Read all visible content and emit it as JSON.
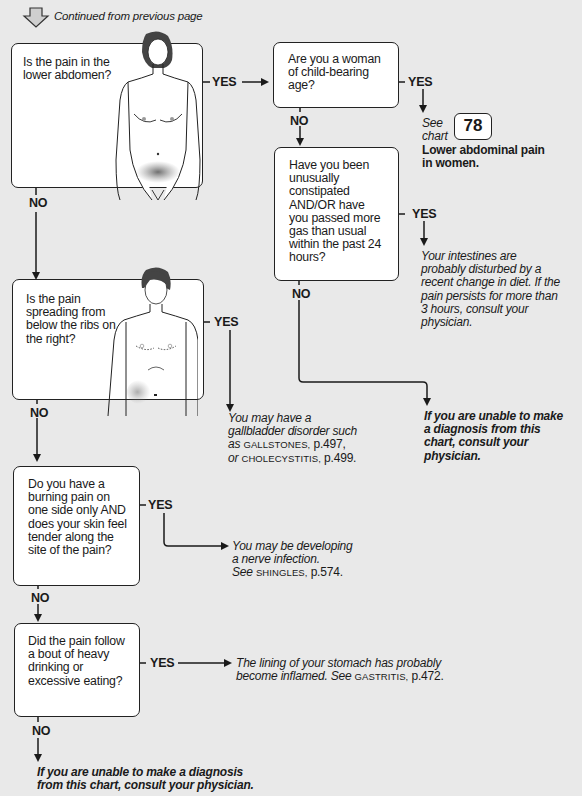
{
  "header": {
    "continued_label": "Continued from previous page",
    "icon": "down-arrow-outline-icon"
  },
  "labels": {
    "yes": "YES",
    "no": "NO"
  },
  "questions": [
    {
      "id": "q1",
      "text": "Is the pain in the lower abdomen?",
      "illustration": "female-figure-lower-abdomen-shaded"
    },
    {
      "id": "q2",
      "text": "Are you a woman of child-bearing age?"
    },
    {
      "id": "q3",
      "text": "Have you been unusually constipated AND/OR have you passed more gas than usual within the past 24 hours?"
    },
    {
      "id": "q4",
      "text": "Is the pain spreading from below the ribs on the right?",
      "illustration": "male-figure-right-upper-abdomen-shaded"
    },
    {
      "id": "q5",
      "text": "Do you have a burning pain on one side only AND does your skin feel tender along the site of the pain?"
    },
    {
      "id": "q6",
      "text": "Did the pain follow a bout of heavy drinking or excessive eating?"
    }
  ],
  "outcomes": {
    "see_chart": {
      "see": "See",
      "chart": "chart",
      "number": "78",
      "title": "Lower abdominal pain in women."
    },
    "intestines": "Your intestines are probably disturbed by a recent change in diet. If the pain persists for more than 3 hours, consult your physician.",
    "unable_right": "If you are unable to make a diagnosis from this chart, consult your physician.",
    "gallbladder": {
      "intro": "You may have a gallbladder disorder such as",
      "ref1": "GALLSTONES,",
      "page1": "p.497,",
      "or": "or",
      "ref2": "CHOLECYSTITIS,",
      "page2": "p.499."
    },
    "shingles": {
      "intro": "You may be developing a nerve infection.",
      "see": "See",
      "ref": "SHINGLES,",
      "page": "p.574."
    },
    "gastritis": {
      "intro": "The lining of your stomach has probably become inflamed.",
      "see": "See",
      "ref": "GASTRITIS,",
      "page": "p.472."
    },
    "unable_bottom": "If you are unable to make a diagnosis from this chart, consult your physician."
  }
}
